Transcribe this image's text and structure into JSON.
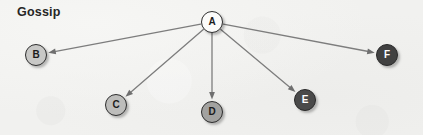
{
  "title": "Gossip",
  "background_color": "#f1f1ef",
  "graph": {
    "type": "directed-graph",
    "root": "A",
    "node_radius": 11,
    "nodes": [
      {
        "id": "A",
        "label": "A",
        "cx": 212,
        "cy": 22,
        "fill": "#fbfbfa",
        "text_color": "#1c1c1c",
        "border_color": "#2e2e2e"
      },
      {
        "id": "B",
        "label": "B",
        "cx": 36,
        "cy": 55,
        "fill": "#c8c8c6",
        "text_color": "#1c1c1c",
        "border_color": "#2e2e2e"
      },
      {
        "id": "C",
        "label": "C",
        "cx": 116,
        "cy": 105,
        "fill": "#bdbdbb",
        "text_color": "#1c1c1c",
        "border_color": "#2e2e2e"
      },
      {
        "id": "D",
        "label": "D",
        "cx": 212,
        "cy": 112,
        "fill": "#a2a2a0",
        "text_color": "#1c1c1c",
        "border_color": "#2e2e2e"
      },
      {
        "id": "E",
        "label": "E",
        "cx": 305,
        "cy": 100,
        "fill": "#4a4a4a",
        "text_color": "#ffffff",
        "border_color": "#2a2a2a"
      },
      {
        "id": "F",
        "label": "F",
        "cx": 387,
        "cy": 55,
        "fill": "#414141",
        "text_color": "#ffffff",
        "border_color": "#2a2a2a"
      }
    ],
    "edges": [
      {
        "from": "A",
        "to": "B",
        "directed": true
      },
      {
        "from": "A",
        "to": "C",
        "directed": true
      },
      {
        "from": "A",
        "to": "D",
        "directed": true
      },
      {
        "from": "A",
        "to": "E",
        "directed": true
      },
      {
        "from": "A",
        "to": "F",
        "directed": true
      }
    ],
    "edge_color": "#7d7d7d",
    "edge_width": 1.3,
    "arrowhead_color": "#6f6f6f"
  }
}
